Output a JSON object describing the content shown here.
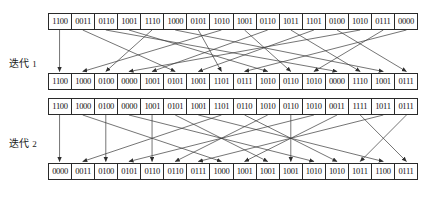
{
  "figure": {
    "type": "permutation-network-diagram",
    "rows": 4,
    "cells_per_row": 16,
    "cell_bits": 4,
    "line_color": "#3a3a3a",
    "border_color": "#2a2a2a",
    "text_color": "#111111"
  },
  "labels": {
    "iteration1": "迭代",
    "iteration1_num": "1",
    "iteration2": "迭代",
    "iteration2_num": "2"
  },
  "rows": [
    {
      "name": "input-row",
      "cells": [
        "1100",
        "0011",
        "0110",
        "1001",
        "1110",
        "1000",
        "0101",
        "1010",
        "1001",
        "0110",
        "1011",
        "1101",
        "0100",
        "1010",
        "0111",
        "0000"
      ]
    },
    {
      "name": "iteration1-output-row",
      "cells": [
        "1100",
        "1000",
        "0100",
        "0000",
        "1001",
        "0101",
        "1001",
        "1101",
        "0111",
        "1010",
        "0110",
        "1010",
        "0000",
        "1110",
        "1001",
        "0111"
      ]
    },
    {
      "name": "iteration2-input-row",
      "cells": [
        "1100",
        "1000",
        "0100",
        "0000",
        "1001",
        "0101",
        "1001",
        "1101",
        "0110",
        "1010",
        "0110",
        "1010",
        "0011",
        "1111",
        "1011",
        "0111"
      ]
    },
    {
      "name": "iteration2-output-row",
      "cells": [
        "0000",
        "0011",
        "0100",
        "0101",
        "0110",
        "0110",
        "0111",
        "1000",
        "1001",
        "1001",
        "1001",
        "1010",
        "1010",
        "1011",
        "1100",
        "0111"
      ]
    }
  ],
  "edges": {
    "iteration1": {
      "from_row": 0,
      "to_row": 1,
      "mapping": [
        0,
        5,
        12,
        9,
        2,
        14,
        7,
        1,
        10,
        4,
        13,
        6,
        15,
        3,
        11,
        8
      ]
    },
    "iteration2": {
      "from_row": 2,
      "to_row": 3,
      "mapping": [
        0,
        7,
        2,
        11,
        4,
        9,
        14,
        1,
        12,
        5,
        10,
        3,
        8,
        15,
        6,
        13
      ]
    }
  }
}
